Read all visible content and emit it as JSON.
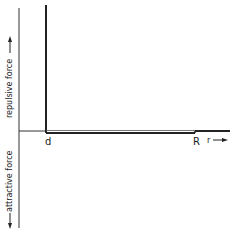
{
  "diagram": {
    "type": "square-well potential force diagram",
    "y_axis_labels": {
      "upper": "repulsive force",
      "lower": "attractive force"
    },
    "x_axis_label": "r",
    "markers": {
      "d": "d",
      "R": "R"
    },
    "colors": {
      "line": "#222222",
      "background": "#ffffff"
    }
  }
}
